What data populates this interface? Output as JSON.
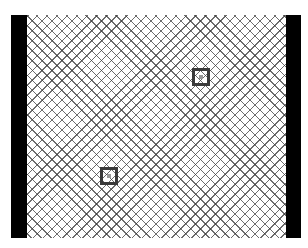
{
  "scene": {
    "description": "Crosshatched play field bounded by black side bars, containing two square target markers",
    "colors": {
      "background": "#ffffff",
      "hatch": "#3c3c3c",
      "side_bars": "#000000",
      "target_border": "#3a3a3a"
    },
    "targets": [
      {
        "id": "target-1",
        "icon": "square-target-icon"
      },
      {
        "id": "target-2",
        "icon": "square-target-icon"
      }
    ]
  }
}
